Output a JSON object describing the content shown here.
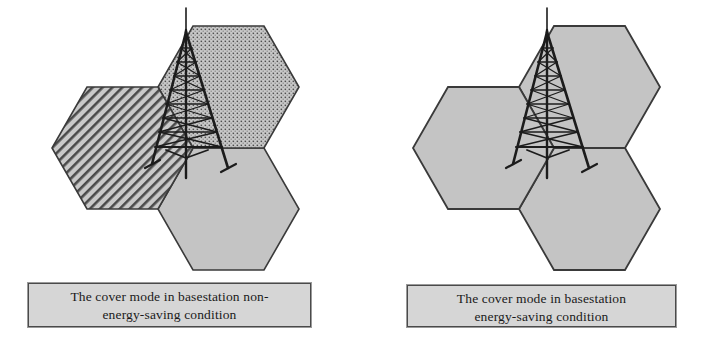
{
  "figure": {
    "kind": "two-panel-diagram",
    "background_color": "#ffffff"
  },
  "panels": [
    {
      "id": "non-energy-saving",
      "caption_lines": [
        "The cover mode in basestation non-",
        "energy-saving condition"
      ],
      "caption_fill": "#d6d6d6",
      "caption_border": "#4a4a4a",
      "cells": [
        {
          "name": "left-sector-cell",
          "fill_style": "diagonal-hatch",
          "fill_color": "#c9c9c9",
          "pattern_color": "#4a4a4a",
          "stroke": "#3a3a3a"
        },
        {
          "name": "upper-right-sector-cell",
          "fill_style": "dot-grid",
          "fill_color": "#c9c9c9",
          "pattern_color": "#4a4a4a",
          "stroke": "#3a3a3a"
        },
        {
          "name": "lower-right-sector-cell",
          "fill_style": "solid",
          "fill_color": "#c4c4c4",
          "pattern_color": "#c4c4c4",
          "stroke": "#3a3a3a"
        }
      ],
      "tower": {
        "name": "basestation-tower",
        "color": "#1c1c1c"
      }
    },
    {
      "id": "energy-saving",
      "caption_lines": [
        "The cover mode in basestation",
        "energy-saving condition"
      ],
      "caption_fill": "#d6d6d6",
      "caption_border": "#4a4a4a",
      "cells": [
        {
          "name": "left-sector-cell",
          "fill_style": "solid",
          "fill_color": "#c4c4c4",
          "pattern_color": "#c4c4c4",
          "stroke": "#3a3a3a"
        },
        {
          "name": "upper-right-sector-cell",
          "fill_style": "solid",
          "fill_color": "#c4c4c4",
          "pattern_color": "#c4c4c4",
          "stroke": "#3a3a3a"
        },
        {
          "name": "lower-right-sector-cell",
          "fill_style": "solid",
          "fill_color": "#c4c4c4",
          "pattern_color": "#c4c4c4",
          "stroke": "#3a3a3a"
        }
      ],
      "tower": {
        "name": "basestation-tower",
        "color": "#1c1c1c"
      }
    }
  ]
}
